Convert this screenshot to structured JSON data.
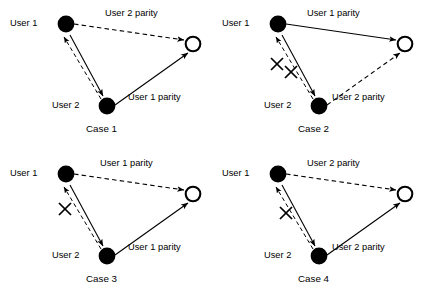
{
  "figure": {
    "node_labels": {
      "user1": "User 1",
      "user2": "User 2"
    },
    "colors": {
      "line": "#000000",
      "filled_node": "#000000",
      "hollow_node_fill": "#ffffff",
      "background": "#ffffff"
    },
    "cases": [
      {
        "id": "case-1",
        "caption": "Case 1",
        "user1_label": "User 1",
        "user2_label": "User 2",
        "top_edge": {
          "label": "User 2 parity",
          "style": "dashed",
          "from": "user1",
          "to": "destination"
        },
        "bottom_edge": {
          "label": "User 1 parity",
          "style": "solid",
          "from": "user2",
          "to": "destination"
        },
        "up_link": {
          "style": "dashed",
          "from": "user2",
          "to": "user1",
          "broken": false
        },
        "down_link": {
          "style": "solid",
          "from": "user1",
          "to": "user2",
          "broken": false
        },
        "crosses": []
      },
      {
        "id": "case-2",
        "caption": "Case 2",
        "user1_label": "User 1",
        "user2_label": "User 2",
        "top_edge": {
          "label": "User 1 parity",
          "style": "solid",
          "from": "user1",
          "to": "destination"
        },
        "bottom_edge": {
          "label": "User 2 parity",
          "style": "dashed",
          "from": "user2",
          "to": "destination"
        },
        "up_link": {
          "style": "dashed",
          "from": "user2",
          "to": "user1",
          "broken": true
        },
        "down_link": {
          "style": "solid",
          "from": "user1",
          "to": "user2",
          "broken": true
        },
        "crosses": [
          "up_link",
          "down_link"
        ]
      },
      {
        "id": "case-3",
        "caption": "Case 3",
        "user1_label": "User 1",
        "user2_label": "User 2",
        "top_edge": {
          "label": "User 1 parity",
          "style": "dashed",
          "from": "user1",
          "to": "destination"
        },
        "bottom_edge": {
          "label": "User 1 parity",
          "style": "solid",
          "from": "user2",
          "to": "destination"
        },
        "up_link": {
          "style": "dashed",
          "from": "user2",
          "to": "user1",
          "broken": true
        },
        "down_link": {
          "style": "solid",
          "from": "user1",
          "to": "user2",
          "broken": false
        },
        "crosses": [
          "up_link"
        ]
      },
      {
        "id": "case-4",
        "caption": "Case 4",
        "user1_label": "User 1",
        "user2_label": "User 2",
        "top_edge": {
          "label": "User 2 parity",
          "style": "dashed",
          "from": "user1",
          "to": "destination"
        },
        "bottom_edge": {
          "label": "User 2 parity",
          "style": "solid",
          "from": "user2",
          "to": "destination"
        },
        "up_link": {
          "style": "dashed",
          "from": "user2",
          "to": "user1",
          "broken": false
        },
        "down_link": {
          "style": "solid",
          "from": "user1",
          "to": "user2",
          "broken": true
        },
        "crosses": [
          "down_link"
        ]
      }
    ]
  }
}
